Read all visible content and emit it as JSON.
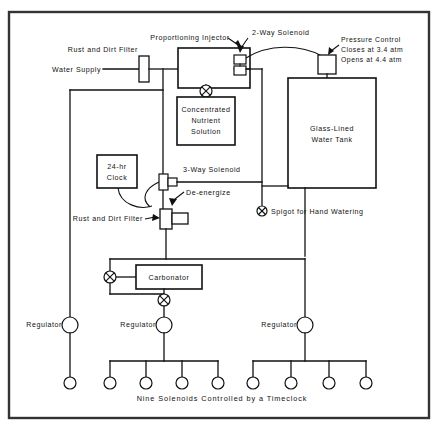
{
  "diagram": {
    "caption": "Nine Solenoids Controlled by a Timeclock",
    "ink_color": "#111111",
    "background_color": "#ffffff",
    "frame_color": "#333333"
  },
  "labels": {
    "water_supply_line1": "Rust and Dirt Filter",
    "water_supply_line2": "Water Supply",
    "proportioning_injector": "Proportioning  Injector",
    "two_way_solenoid": "2-Way  Solenoid",
    "pressure_control_line1": "Pressure  Control",
    "pressure_control_line2": "Closes  at  3.4 atm",
    "pressure_control_line3": "Opens  at  4.4 atm",
    "nutrient_line1": "Concentrated",
    "nutrient_line2": "Nutrient",
    "nutrient_line3": "Solution",
    "tank_line1": "Glass-Lined",
    "tank_line2": "Water Tank",
    "clock_line1": "24-hr",
    "clock_line2": "Clock",
    "three_way_solenoid": "3-Way  Solenoid",
    "de_energize": "De-energize",
    "rust_and_dirt_filter": "Rust and Dirt Filter",
    "spigot": "Spigot for Hand Watering",
    "carbonator": "Carbonator",
    "regulator_left": "Regulator",
    "regulator_center": "Regulator",
    "regulator_right": "Regulator"
  },
  "components": {
    "injector": {
      "x": 178,
      "y": 48,
      "w": 72,
      "h": 40
    },
    "nutrient_tank": {
      "x": 177,
      "y": 97,
      "w": 58,
      "h": 48
    },
    "water_tank": {
      "x": 288,
      "y": 78,
      "w": 88,
      "h": 110
    },
    "clock": {
      "x": 97,
      "y": 155,
      "w": 40,
      "h": 33
    },
    "carbonator": {
      "x": 136,
      "y": 265,
      "w": 66,
      "h": 24
    },
    "pressure_control": {
      "x": 318,
      "y": 55,
      "w": 18,
      "h": 19
    },
    "supply_filter": {
      "x": 139,
      "y": 56,
      "w": 10,
      "h": 26
    },
    "lower_filter": {
      "x": 160,
      "y": 209,
      "w": 12,
      "h": 20
    },
    "lower_filter_nub": {
      "x": 172,
      "y": 213,
      "w": 16,
      "h": 11
    },
    "two_way_solenoid_sym": {
      "x": 234,
      "y": 55,
      "w": 12,
      "h": 22
    },
    "three_way_solenoid_sym": {
      "x": 159,
      "y": 174,
      "w": 9,
      "h": 16
    },
    "three_way_nub": {
      "x": 168,
      "y": 178,
      "w": 9,
      "h": 8
    }
  },
  "valves": [
    {
      "name": "injector-valve",
      "cx": 206,
      "cy": 91,
      "r": 6
    },
    {
      "name": "spigot-valve",
      "cx": 262,
      "cy": 211,
      "r": 5
    },
    {
      "name": "carbonator-inlet-valve",
      "cx": 122,
      "cy": 277,
      "r": 6
    },
    {
      "name": "carbonator-outlet-valve",
      "cx": 164,
      "cy": 300,
      "r": 6
    }
  ],
  "regulators": [
    {
      "name": "regulator-left",
      "cx": 70,
      "cy": 325,
      "r": 8
    },
    {
      "name": "regulator-center",
      "cx": 164,
      "cy": 325,
      "r": 8
    },
    {
      "name": "regulator-right",
      "cx": 305,
      "cy": 325,
      "r": 8
    }
  ],
  "solenoid_outlets": {
    "radius": 6,
    "cy": 383,
    "count": 9,
    "left_group": [
      70
    ],
    "center_group": [
      110,
      146,
      182,
      218
    ],
    "right_group": [
      253,
      291,
      329,
      366
    ]
  },
  "frame": {
    "x": 9,
    "y": 12,
    "w": 420,
    "h": 406
  }
}
